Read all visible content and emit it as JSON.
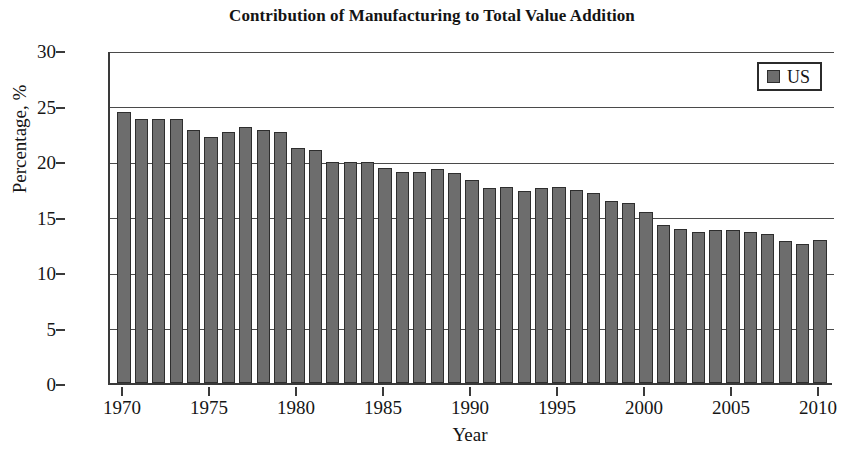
{
  "chart_data": {
    "type": "bar",
    "title": "Contribution of Manufacturing to Total Value Addition",
    "xlabel": "Year",
    "ylabel": "Percentage, %",
    "ylim": [
      0,
      30
    ],
    "ytick_values": [
      0,
      5,
      10,
      15,
      20,
      25,
      30
    ],
    "ytick_labels": [
      "0",
      "5",
      "10",
      "15",
      "20",
      "25",
      "30"
    ],
    "xlim": [
      1969.2,
      2010.8
    ],
    "xtick_values": [
      1970,
      1975,
      1980,
      1985,
      1990,
      1995,
      2000,
      2005,
      2010
    ],
    "xtick_labels": [
      "1970",
      "1975",
      "1980",
      "1985",
      "1990",
      "1995",
      "2000",
      "2005",
      "2010"
    ],
    "grid": "horizontal",
    "legend_position": "top-right",
    "legend": [
      "US"
    ],
    "bar_color": "#6d6d6d",
    "bar_edge_color": "#2e2e2e",
    "categories": [
      1970,
      1971,
      1972,
      1973,
      1974,
      1975,
      1976,
      1977,
      1978,
      1979,
      1980,
      1981,
      1982,
      1983,
      1984,
      1985,
      1986,
      1987,
      1988,
      1989,
      1990,
      1991,
      1992,
      1993,
      1994,
      1995,
      1996,
      1997,
      1998,
      1999,
      2000,
      2001,
      2002,
      2003,
      2004,
      2005,
      2006,
      2007,
      2008,
      2009,
      2010
    ],
    "series": [
      {
        "name": "US",
        "values": [
          24.4,
          23.8,
          23.8,
          23.8,
          22.8,
          22.2,
          22.6,
          23.1,
          22.8,
          22.6,
          21.2,
          21.0,
          19.9,
          19.9,
          19.9,
          19.4,
          19.0,
          19.0,
          19.3,
          18.9,
          18.3,
          17.6,
          17.7,
          17.3,
          17.6,
          17.7,
          17.4,
          17.1,
          16.4,
          16.2,
          15.4,
          14.2,
          13.9,
          13.6,
          13.8,
          13.8,
          13.6,
          13.4,
          12.8,
          12.5,
          12.9
        ]
      }
    ]
  },
  "chart": {
    "title": "Contribution of Manufacturing to Total Value Addition",
    "y_axis_title": "Percentage, %",
    "x_axis_title": "Year",
    "legend_label": "US"
  }
}
